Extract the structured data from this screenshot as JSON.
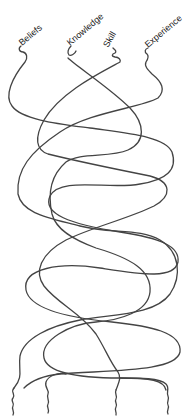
{
  "diagram": {
    "type": "braided-strands",
    "stroke_color": "#444444",
    "background": "#ffffff",
    "strands": [
      {
        "id": "beliefs",
        "label": "Beliefs"
      },
      {
        "id": "knowledge",
        "label": "Knowledge"
      },
      {
        "id": "skill",
        "label": "Skill"
      },
      {
        "id": "experience",
        "label": "Experience"
      }
    ],
    "bottom_tails": 4
  }
}
